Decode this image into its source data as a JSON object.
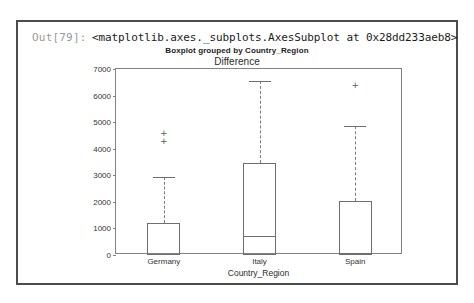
{
  "cell": {
    "prompt": "Out[79]:",
    "repr": "<matplotlib.axes._subplots.AxesSubplot at 0x28dd233aeb8>"
  },
  "chart_data": {
    "type": "box",
    "suptitle": "Boxplot grouped by Country_Region",
    "title": "Difference",
    "xlabel": "Country_Region",
    "ylabel": "",
    "categories": [
      "Germany",
      "Italy",
      "Spain"
    ],
    "ylim": [
      0,
      7000
    ],
    "yticks": [
      0,
      1000,
      2000,
      3000,
      4000,
      5000,
      6000,
      7000
    ],
    "ytick_labels": [
      "0",
      "1000",
      "2000",
      "3000",
      "4000",
      "5000",
      "6000",
      "7000"
    ],
    "grid": false,
    "legend": null,
    "boxes": [
      {
        "name": "Germany",
        "whisker_low": 0,
        "q1": 0,
        "median": 50,
        "q3": 1200,
        "whisker_high": 2950,
        "fliers": [
          4300,
          4600
        ]
      },
      {
        "name": "Italy",
        "whisker_low": 0,
        "q1": 0,
        "median": 700,
        "q3": 3450,
        "whisker_high": 6550,
        "fliers": []
      },
      {
        "name": "Spain",
        "whisker_low": 0,
        "q1": 0,
        "median": 60,
        "q3": 2050,
        "whisker_high": 4850,
        "fliers": [
          6400
        ]
      }
    ]
  },
  "colors": {
    "cell_border": "#4c4c4c",
    "axes_line": "#828282",
    "box_line": "#6e6e6e",
    "prompt_text": "#9a9a9a",
    "repr_text": "#1a1a1a"
  }
}
